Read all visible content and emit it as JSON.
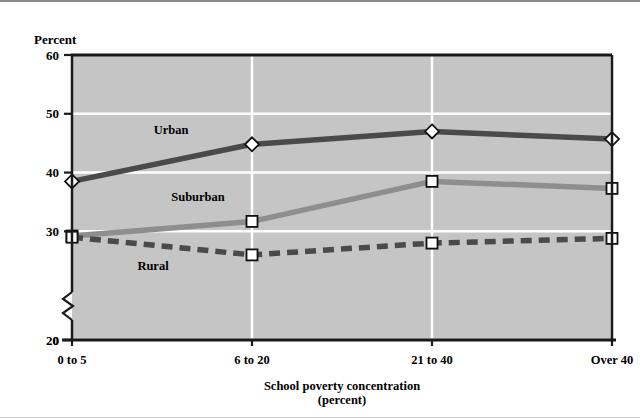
{
  "figure": {
    "y_axis_label": "Percent",
    "x_axis_title_line1": "School poverty concentration",
    "x_axis_title_line2": "(percent)",
    "axis_break": "zigzag-break"
  },
  "chart_data": {
    "type": "line",
    "title": "",
    "xlabel": "School poverty concentration (percent)",
    "ylabel": "Percent",
    "categories": [
      "0 to 5",
      "6 to 20",
      "21 to 40",
      "Over 40"
    ],
    "ylim": [
      0,
      60
    ],
    "y_ticks": [
      "0",
      "20",
      "30",
      "40",
      "50",
      "60"
    ],
    "y_tick_values": [
      0,
      20,
      30,
      40,
      50,
      60
    ],
    "y_axis_break_between": [
      0,
      20
    ],
    "grid": "horizontal-and-vertical-white",
    "legend": "inline-labels",
    "series": [
      {
        "name": "Urban",
        "values": [
          38.5,
          44.8,
          47.0,
          45.7
        ],
        "color": "#4a4a4a",
        "style": "solid",
        "marker": "diamond",
        "label_x_index": 0.55,
        "label_value": 46.5
      },
      {
        "name": "Suburban",
        "values": [
          29.2,
          31.7,
          38.5,
          37.3
        ],
        "color": "#8e8e8e",
        "style": "solid",
        "marker": "square",
        "label_x_index": 0.7,
        "label_value": 35.2
      },
      {
        "name": "Rural",
        "values": [
          29.0,
          26.0,
          28.0,
          28.8
        ],
        "color": "#4a4a4a",
        "style": "dashed",
        "marker": "square",
        "label_x_index": 0.45,
        "label_value": 23.4
      }
    ],
    "colors": {
      "plot_background": "#c5c5c5",
      "gridline": "#ffffff",
      "axis": "#1a1a1a",
      "urban": "#4a4a4a",
      "suburban": "#8e8e8e",
      "rural": "#4a4a4a",
      "marker_fill": "#ffffff"
    }
  }
}
